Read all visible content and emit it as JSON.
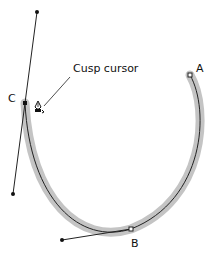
{
  "diagram": {
    "annotation": "Cusp cursor",
    "points": {
      "a": {
        "label": "A"
      },
      "b": {
        "label": "B"
      },
      "c": {
        "label": "C"
      }
    },
    "colors": {
      "stroke_highlight": "#c4c4c4",
      "path": "#222222",
      "handle": "#111111"
    }
  }
}
